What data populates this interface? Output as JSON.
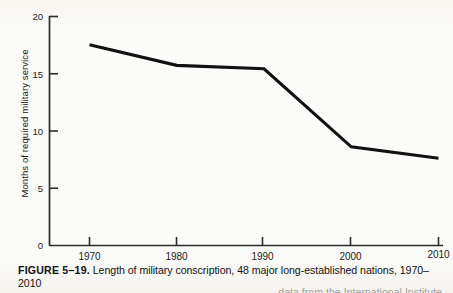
{
  "figure": {
    "number_label": "FIGURE 5–19.",
    "caption": " Length of military conscription, 48 major long-established nations, 1970–2010",
    "caption_continued": "data from the International Institute"
  },
  "chart_data": {
    "type": "line",
    "title": "",
    "xlabel": "",
    "ylabel": "Months of required military service",
    "categories": [
      "1970",
      "1980",
      "1990",
      "2000",
      "2010"
    ],
    "x": [
      1970,
      1980,
      1990,
      2000,
      2010
    ],
    "values": [
      17.5,
      15.7,
      15.4,
      8.6,
      7.6
    ],
    "series": [
      {
        "name": "Months of required military service",
        "values": [
          17.5,
          15.7,
          15.4,
          8.6,
          7.6
        ]
      }
    ],
    "xlim": [
      1965,
      2013
    ],
    "ylim": [
      0,
      20
    ],
    "ytick_labels": [
      "0",
      "5",
      "10",
      "15",
      "20"
    ],
    "yticks": [
      0,
      5,
      10,
      15,
      20
    ],
    "xtick_labels": [
      "1970",
      "1980",
      "1990",
      "2000",
      "2010"
    ],
    "grid": false,
    "legend": "none",
    "line_color": "#111111",
    "axis_color": "#2b2b2b"
  },
  "axis": {
    "y_title": "Months of required military service"
  }
}
